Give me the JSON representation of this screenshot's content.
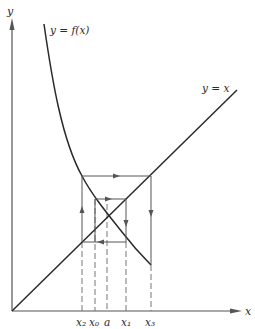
{
  "diagram": {
    "type": "fixed-point-iteration-cobweb",
    "curves": {
      "f_label": "y = f(x)",
      "identity_label": "y = x"
    },
    "axes": {
      "x_label": "x",
      "y_label": "y"
    },
    "tick_labels": {
      "x2": "x₂",
      "x0": "x₀",
      "a": "a",
      "x1": "x₁",
      "x3": "x₃"
    },
    "colors": {
      "line": "#2a2a2a",
      "guide": "#555555",
      "background": "#ffffff"
    }
  }
}
